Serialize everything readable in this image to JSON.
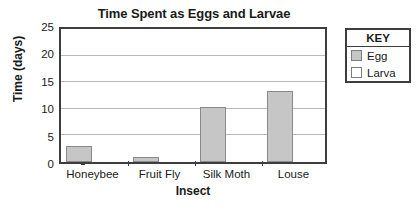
{
  "chart_data": {
    "type": "bar",
    "title": "Time Spent as Eggs and Larvae",
    "xlabel": "Insect",
    "ylabel": "Time (days)",
    "categories": [
      "Honeybee",
      "Fruit Fly",
      "Silk Moth",
      "Louse"
    ],
    "series": [
      {
        "name": "Egg",
        "values": [
          3,
          1,
          10,
          13
        ],
        "color": "#c6c6c6"
      },
      {
        "name": "Larva",
        "values": [
          0,
          0,
          0,
          0
        ],
        "color": "#ffffff"
      }
    ],
    "ylim": [
      0,
      25
    ],
    "yticks": [
      0,
      5,
      10,
      15,
      20,
      25
    ],
    "ytick_labels": [
      "0",
      "5",
      "10",
      "15",
      "20",
      "25"
    ],
    "grid": true,
    "legend_position": "right-outside",
    "legend_title": "KEY"
  },
  "legend": {
    "title": "KEY",
    "entries": [
      {
        "label": "Egg",
        "color": "#c6c6c6"
      },
      {
        "label": "Larva",
        "color": "#ffffff"
      }
    ]
  }
}
